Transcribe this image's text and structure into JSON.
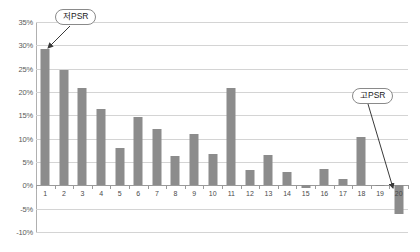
{
  "chart_data": {
    "type": "bar",
    "title": "",
    "subtitle": "",
    "xlabel": "",
    "ylabel": "",
    "categories": [
      "1",
      "2",
      "3",
      "4",
      "5",
      "6",
      "7",
      "8",
      "9",
      "10",
      "11",
      "12",
      "13",
      "14",
      "15",
      "16",
      "17",
      "18",
      "19",
      "20"
    ],
    "values": [
      29.3,
      24.8,
      20.8,
      16.4,
      7.9,
      14.6,
      12.1,
      6.2,
      11.0,
      6.7,
      20.8,
      3.2,
      6.5,
      2.8,
      -0.6,
      3.4,
      1.3,
      10.3,
      -0.1,
      -6.2
    ],
    "series": [
      {
        "name": "",
        "values": [
          29.3,
          24.8,
          20.8,
          16.4,
          7.9,
          14.6,
          12.1,
          6.2,
          11.0,
          6.7,
          20.8,
          3.2,
          6.5,
          2.8,
          -0.6,
          3.4,
          1.3,
          10.3,
          -0.1,
          -6.2
        ]
      }
    ],
    "ylim": [
      -10,
      35
    ],
    "ytick_step": 5,
    "ytick_labels": [
      "35%",
      "30%",
      "25%",
      "20%",
      "15%",
      "10%",
      "5%",
      "0%",
      "-5%",
      "-10%"
    ],
    "ytick_values": [
      35,
      30,
      25,
      20,
      15,
      10,
      5,
      0,
      -5,
      -10
    ],
    "grid": true,
    "grid_axis": "y",
    "legend": false,
    "legend_position": "none",
    "bar_color": "#8c8c8c",
    "gridline_color": "#d4d4d4",
    "axis_color": "#9a9a9a",
    "annotations": [
      {
        "id": "low-psr",
        "label": "저PSR",
        "target_category": "1",
        "target_value": 29.3
      },
      {
        "id": "high-psr",
        "label": "고PSR",
        "target_category": "20",
        "target_value": -6.2
      }
    ]
  }
}
